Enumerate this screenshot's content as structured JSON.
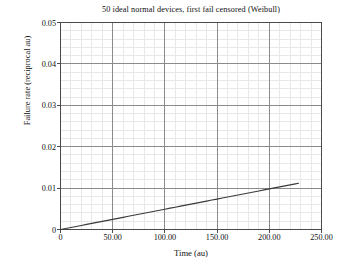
{
  "chart_data": {
    "type": "line",
    "title": "50 ideal normal devices, first fail censored (Weibull)",
    "xlabel": "Time (au)",
    "ylabel": "Failure rate (reciprocal au)",
    "xlim": [
      0,
      250
    ],
    "ylim": [
      0,
      0.05
    ],
    "grid": true,
    "minor_grid": true,
    "minor_ticks_per_major": 5,
    "legend": null,
    "xticks": [
      0,
      50,
      100,
      150,
      200,
      250
    ],
    "xtick_labels": [
      "0",
      "50.00",
      "100.00",
      "150.00",
      "200.00",
      "250.00"
    ],
    "yticks": [
      0,
      0.01,
      0.02,
      0.03,
      0.04,
      0.05
    ],
    "ytick_labels": [
      "0",
      "0.01",
      "0.02",
      "0.03",
      "0.04",
      "0.05"
    ],
    "series": [
      {
        "name": "Weibull hazard rate",
        "color": "#3a3a3a",
        "x": [
          0,
          5,
          10,
          15,
          20,
          25,
          30,
          35,
          40,
          45,
          50,
          55,
          60,
          65,
          70,
          75,
          80,
          85,
          90,
          95,
          100,
          105,
          110,
          115,
          120,
          125,
          130,
          135,
          140,
          145,
          150,
          155,
          160,
          165,
          170,
          175,
          180,
          185,
          190,
          195,
          200,
          205,
          210,
          215,
          220,
          225,
          228
        ],
        "y": [
          0.0,
          0.00024,
          0.00049,
          0.00074,
          0.00098,
          0.00123,
          0.00147,
          0.00172,
          0.00196,
          0.00221,
          0.00245,
          0.0027,
          0.00294,
          0.00319,
          0.00343,
          0.00368,
          0.00392,
          0.00417,
          0.00441,
          0.00466,
          0.0049,
          0.00515,
          0.00539,
          0.00564,
          0.00588,
          0.00613,
          0.00637,
          0.00662,
          0.00686,
          0.00711,
          0.00735,
          0.0076,
          0.00784,
          0.00809,
          0.00833,
          0.00858,
          0.00882,
          0.00907,
          0.00931,
          0.00956,
          0.0098,
          0.01005,
          0.01029,
          0.01054,
          0.01078,
          0.01103,
          0.01118
        ]
      }
    ],
    "curve_model": {
      "family": "weibull-hazard",
      "shape_beta": 2.0,
      "scale_eta": 143.0,
      "formula": "h(t) = (beta/eta) * (t/eta)^(beta-1)",
      "reference_points": [
        {
          "t": 0,
          "h": 0.0
        },
        {
          "t": 50,
          "h": 0.0024
        },
        {
          "t": 103,
          "h": 0.01
        },
        {
          "t": 150,
          "h": 0.0205
        },
        {
          "t": 200,
          "h": 0.0395
        },
        {
          "t": 228,
          "h": 0.05
        }
      ]
    }
  },
  "style": {
    "axis_color": "#4a4a4a",
    "major_grid_color": "#8a8a8a",
    "minor_grid_color": "#e8e8e8",
    "curve_color": "#3b3b3b",
    "background": "#ffffff",
    "text_color": "#101010"
  }
}
